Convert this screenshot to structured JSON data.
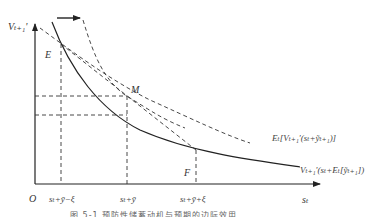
{
  "diagram": {
    "y_axis_label": "Vₜ₊₁'",
    "x_axis_label": "sₜ",
    "origin_label": "O",
    "points": [
      {
        "name": "E",
        "label": "E"
      },
      {
        "name": "M",
        "label": "M"
      },
      {
        "name": "F",
        "label": "F"
      }
    ],
    "x_ticks": [
      "sₜ+ȳ−ξ",
      "sₜ+ȳ",
      "sₜ+ȳ+ξ"
    ],
    "curves": [
      {
        "name": "marginal-utility-curve",
        "style": "solid",
        "label": "Vₜ₊₁'(sₜ+Eₜ[ỹₜ₊₁])"
      },
      {
        "name": "expected-marginal-utility-curve",
        "style": "dashed",
        "label": "Eₜ[Vₜ₊₁'(sₜ+ỹₜ₊₁)]"
      },
      {
        "name": "shifted-curve",
        "style": "dashed",
        "label": ""
      }
    ],
    "shift_arrow": "right",
    "caption": "图 5-1  预防性储蓄动机与预期的边际效用"
  }
}
